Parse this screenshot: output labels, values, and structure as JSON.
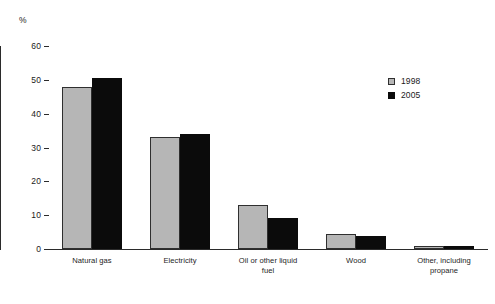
{
  "chart_data": {
    "type": "bar",
    "title": "",
    "subtitle": "",
    "xlabel": "",
    "ylabel": "%",
    "unit_label": "%",
    "ylim": [
      0,
      60
    ],
    "ytick_values": [
      0,
      10,
      20,
      30,
      40,
      50,
      60
    ],
    "ytick_labels": [
      "0",
      "10",
      "20",
      "30",
      "40",
      "50",
      "60"
    ],
    "grid": false,
    "legend_position": "top-right",
    "categories": [
      "Natural gas",
      "Electricity",
      "Oil or other liquid fuel",
      "Wood",
      "Other, including propane"
    ],
    "category_lines": [
      [
        "Natural gas"
      ],
      [
        "Electricity"
      ],
      [
        "Oil or other liquid",
        "fuel"
      ],
      [
        "Wood"
      ],
      [
        "Other, including",
        "propane"
      ]
    ],
    "series": [
      {
        "name": "1998",
        "color": "#b6b6b6",
        "values": [
          48,
          33,
          13,
          4.3,
          1
        ]
      },
      {
        "name": "2005",
        "color": "#0b0b0b",
        "values": [
          50.5,
          34,
          9.2,
          3.8,
          0.8
        ]
      }
    ],
    "legend": [
      {
        "label": "1998",
        "color": "#b6b6b6"
      },
      {
        "label": "2005",
        "color": "#0b0b0b"
      }
    ],
    "axis_color": "#2b2b2b"
  }
}
